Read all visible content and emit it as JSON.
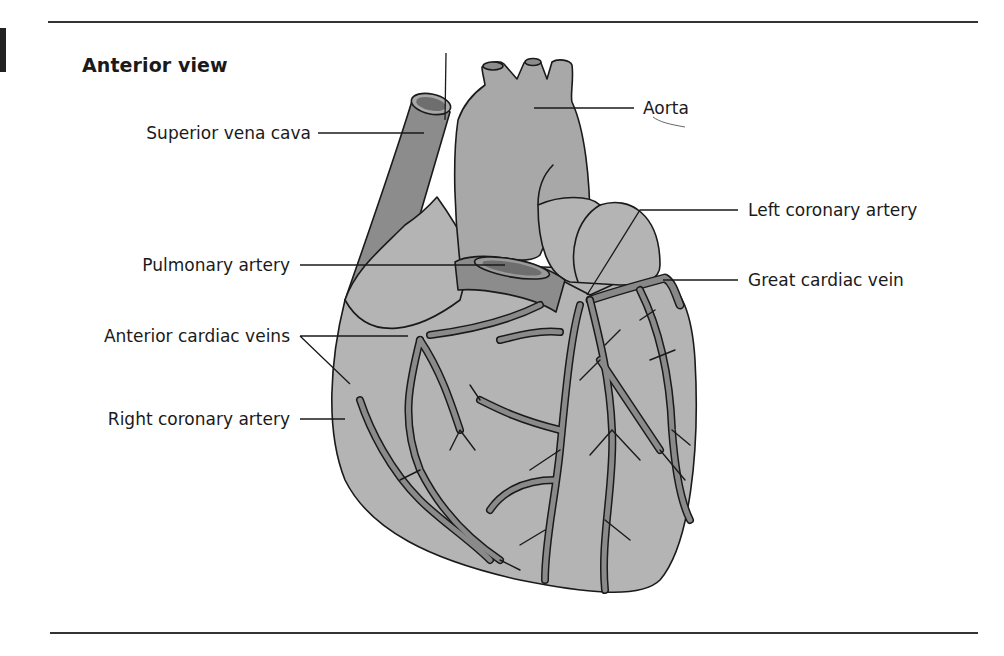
{
  "figure": {
    "title": "Anterior view",
    "labels": {
      "superior_vena_cava": "Superior vena cava",
      "aorta": "Aorta",
      "left_coronary_artery": "Left coronary artery",
      "great_cardiac_vein": "Great cardiac vein",
      "pulmonary_artery": "Pulmonary artery",
      "anterior_cardiac_veins": "Anterior cardiac veins",
      "right_coronary_artery": "Right coronary artery"
    },
    "colors": {
      "heart_fill": "#b4b4b4",
      "vessel_dark": "#888888",
      "vena_cava": "#8c8c8c",
      "lumen": "#6e6e6e",
      "outline": "#1a1a1a",
      "rule": "#333333"
    }
  }
}
